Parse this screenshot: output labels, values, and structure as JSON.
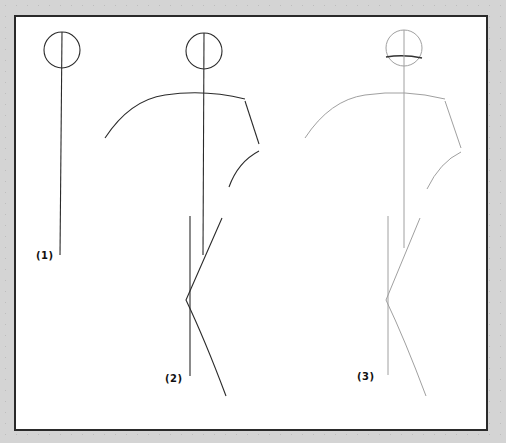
{
  "colors": {
    "background": "#d4d4d4",
    "panel": "#ffffff",
    "dark_line": "#2b2b2b",
    "light_line": "#9a9a9a",
    "head_arc": "#333333"
  },
  "steps": [
    {
      "label": "(1)",
      "label_pos": [
        36,
        250
      ]
    },
    {
      "label": "(2)",
      "label_pos": [
        165,
        373
      ]
    },
    {
      "label": "(3)",
      "label_pos": [
        357,
        371
      ]
    }
  ],
  "shapes": {
    "fig1": {
      "head": {
        "cx": 62,
        "cy": 50,
        "r": 18
      },
      "spine": "M62 32 L60 255"
    },
    "fig2": {
      "head": {
        "cx": 204,
        "cy": 51,
        "r": 18
      },
      "spine": "M204 33 L203 255",
      "shoulders": "M105 138 Q130 100 165 95 Q205 89 245 99",
      "right_arm_upper": "M245 101 L259 144",
      "right_arm_lower": "M259 151 Q238 162 229 187",
      "left_leg": "M190 216 L190 376",
      "right_leg": "M222 218 L186 300 Q205 340 226 396"
    },
    "fig3": {
      "head": {
        "cx": 404,
        "cy": 48,
        "r": 18
      },
      "head_arc": "M386 57 Q404 54 422 58",
      "spine": "M404 30 L404 248",
      "shoulders": "M305 138 Q330 100 365 95 Q405 89 445 99",
      "right_arm_upper": "M445 101 L461 148",
      "right_arm_lower": "M461 152 Q440 162 427 189",
      "left_leg": "M388 216 L388 375",
      "right_leg": "M420 218 L386 300 Q405 340 426 396"
    }
  }
}
